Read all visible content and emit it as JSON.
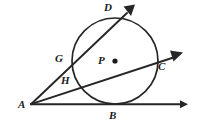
{
  "figure": {
    "background_color": "#ffffff",
    "stroke_color": "#262626",
    "label_color": "#1a1a1a",
    "width": 198,
    "height": 127
  },
  "circle": {
    "center_label": "P",
    "center_x": 115,
    "center_y": 61,
    "radius": 43
  },
  "labels": {
    "a": "A",
    "b": "B",
    "c": "C",
    "d": "D",
    "g": "G",
    "h": "H",
    "p": "P"
  },
  "points": {
    "A": {
      "label": "A",
      "x": 31,
      "y": 104,
      "label_x": 18,
      "label_y": 99
    },
    "B": {
      "label": "B",
      "x": 115,
      "y": 104,
      "label_x": 110,
      "label_y": 110
    },
    "C": {
      "label": "C",
      "x": 155,
      "y": 63,
      "label_x": 158,
      "label_y": 61
    },
    "D": {
      "label": "D",
      "x": 118,
      "y": 21,
      "label_x": 104,
      "label_y": 2
    },
    "G": {
      "label": "G",
      "x": 73,
      "y": 67,
      "label_x": 56,
      "label_y": 54
    },
    "H": {
      "label": "H",
      "x": 77,
      "y": 88,
      "label_x": 61,
      "label_y": 76
    },
    "P": {
      "label": "P",
      "x": 115,
      "y": 61,
      "label_x": 98,
      "label_y": 56
    }
  },
  "rays": [
    {
      "name": "ray-AD",
      "from": "A",
      "through": [
        "G",
        "D"
      ],
      "arrow_tip_x": 133,
      "arrow_tip_y": 6
    },
    {
      "name": "ray-AC",
      "from": "A",
      "through": [
        "H",
        "C"
      ],
      "arrow_tip_x": 181,
      "arrow_tip_y": 54
    },
    {
      "name": "ray-AB",
      "from": "A",
      "through": [
        "B"
      ],
      "arrow_tip_x": 186,
      "arrow_tip_y": 104
    }
  ]
}
